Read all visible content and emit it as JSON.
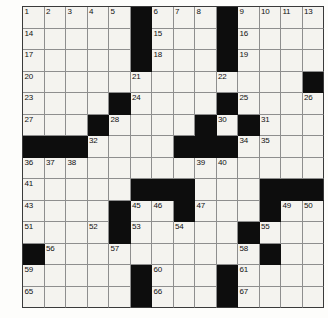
{
  "puzzle": {
    "type": "crossword-grid",
    "title": "Crossword Puzzle Grid",
    "rows": 14,
    "columns": 14,
    "cell_size_px": 21.5,
    "colors": {
      "block": "#0d0d0d",
      "open": "#f4f3ef",
      "grid_line": "#8e8e8e",
      "frame": "#3a3a3a",
      "number_text": "#111111",
      "page_background": "#ffffff"
    },
    "legend": {
      "block_marker": "#",
      "open_marker": "."
    },
    "grid_layout": [
      ".....#...#....",
      ".....#...#....",
      ".....#...#....",
      ".............#",
      "....#....#....",
      "...#....#.#...",
      "###....###....",
      "..............",
      ".....###...###",
      "....#..#...#..",
      "....#.....#...",
      "#..........#..",
      ".....#...#....",
      ".....#...#...."
    ],
    "numbered_cells": [
      {
        "number": 1,
        "row": 0,
        "col": 0
      },
      {
        "number": 2,
        "row": 0,
        "col": 1
      },
      {
        "number": 3,
        "row": 0,
        "col": 2
      },
      {
        "number": 4,
        "row": 0,
        "col": 3
      },
      {
        "number": 5,
        "row": 0,
        "col": 4
      },
      {
        "number": 6,
        "row": 0,
        "col": 6
      },
      {
        "number": 7,
        "row": 0,
        "col": 7
      },
      {
        "number": 8,
        "row": 0,
        "col": 8
      },
      {
        "number": 9,
        "row": 0,
        "col": 10
      },
      {
        "number": 10,
        "row": 0,
        "col": 11
      },
      {
        "number": 11,
        "row": 0,
        "col": 12
      },
      {
        "number": 12,
        "row": 0,
        "col": 13
      },
      {
        "number": 13,
        "row": 0,
        "col": 14
      },
      {
        "number": 14,
        "row": 1,
        "col": 0
      },
      {
        "number": 15,
        "row": 1,
        "col": 6
      },
      {
        "number": 16,
        "row": 1,
        "col": 10
      },
      {
        "number": 17,
        "row": 2,
        "col": 0
      },
      {
        "number": 18,
        "row": 2,
        "col": 6
      },
      {
        "number": 19,
        "row": 2,
        "col": 10
      },
      {
        "number": 20,
        "row": 3,
        "col": 0
      },
      {
        "number": 21,
        "row": 3,
        "col": 5
      },
      {
        "number": 22,
        "row": 3,
        "col": 9
      },
      {
        "number": 23,
        "row": 4,
        "col": 0
      },
      {
        "number": 24,
        "row": 4,
        "col": 5
      },
      {
        "number": 25,
        "row": 4,
        "col": 10
      },
      {
        "number": 26,
        "row": 4,
        "col": 13
      },
      {
        "number": 27,
        "row": 5,
        "col": 0
      },
      {
        "number": 28,
        "row": 5,
        "col": 4
      },
      {
        "number": 29,
        "row": 5,
        "col": 8
      },
      {
        "number": 30,
        "row": 5,
        "col": 9
      },
      {
        "number": 31,
        "row": 5,
        "col": 11
      },
      {
        "number": 32,
        "row": 6,
        "col": 3
      },
      {
        "number": 33,
        "row": 6,
        "col": 7
      },
      {
        "number": 34,
        "row": 6,
        "col": 10
      },
      {
        "number": 35,
        "row": 6,
        "col": 11
      },
      {
        "number": 36,
        "row": 7,
        "col": 0
      },
      {
        "number": 37,
        "row": 7,
        "col": 1
      },
      {
        "number": 38,
        "row": 7,
        "col": 2
      },
      {
        "number": 39,
        "row": 7,
        "col": 8
      },
      {
        "number": 40,
        "row": 7,
        "col": 9
      },
      {
        "number": 41,
        "row": 8,
        "col": 0
      },
      {
        "number": 42,
        "row": 8,
        "col": 7
      },
      {
        "number": 43,
        "row": 9,
        "col": 0
      },
      {
        "number": 44,
        "row": 9,
        "col": 4
      },
      {
        "number": 45,
        "row": 9,
        "col": 5
      },
      {
        "number": 46,
        "row": 9,
        "col": 6
      },
      {
        "number": 47,
        "row": 9,
        "col": 8
      },
      {
        "number": 48,
        "row": 9,
        "col": 11
      },
      {
        "number": 49,
        "row": 9,
        "col": 12
      },
      {
        "number": 50,
        "row": 9,
        "col": 13
      },
      {
        "number": 51,
        "row": 10,
        "col": 0
      },
      {
        "number": 52,
        "row": 10,
        "col": 3
      },
      {
        "number": 53,
        "row": 10,
        "col": 5
      },
      {
        "number": 54,
        "row": 10,
        "col": 7
      },
      {
        "number": 55,
        "row": 10,
        "col": 11
      },
      {
        "number": 56,
        "row": 11,
        "col": 1
      },
      {
        "number": 57,
        "row": 11,
        "col": 4
      },
      {
        "number": 58,
        "row": 11,
        "col": 10
      },
      {
        "number": 59,
        "row": 12,
        "col": 0
      },
      {
        "number": 60,
        "row": 12,
        "col": 6
      },
      {
        "number": 61,
        "row": 12,
        "col": 10
      },
      {
        "number": 62,
        "row": 13,
        "col": 0
      },
      {
        "number": 63,
        "row": 13,
        "col": 6
      },
      {
        "number": 64,
        "row": 13,
        "col": 10
      },
      {
        "number": 65,
        "row": 14,
        "col": 0
      },
      {
        "number": 66,
        "row": 14,
        "col": 6
      },
      {
        "number": 67,
        "row": 14,
        "col": 10
      }
    ],
    "entered_letters": []
  }
}
